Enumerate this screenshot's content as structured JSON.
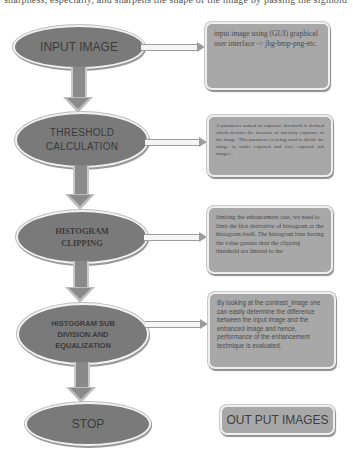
{
  "header": {
    "cut_text": "sharpness, especially, and sharpens the shape of the image by passing the sigmoid function"
  },
  "flowchart": {
    "steps": [
      {
        "id": "input-image",
        "label_lines": [
          "INPUT IMAGE"
        ]
      },
      {
        "id": "threshold-calculation",
        "label_lines": [
          "THRESHOLD",
          "CALCULATION"
        ]
      },
      {
        "id": "histogram-clipping",
        "label_lines": [
          "HISTOGRAM",
          "CLIPPING"
        ]
      },
      {
        "id": "histogram-sub-division",
        "label_lines": [
          "HISTOGRAM SUB",
          "DIVISION AND",
          "EQUALIZATION"
        ]
      },
      {
        "id": "stop",
        "label_lines": [
          "STOP"
        ]
      }
    ],
    "notes": [
      {
        "for": "input-image",
        "text": "input image using (GUI) graphical user interface -> jbg-bmp-png-etc."
      },
      {
        "for": "threshold-calculation",
        "text": "A parameter named as exposure threshold is defined which denotes the measure of intensity exposure of the image. This parameter is being used to divide the image in under exposed and over exposed sub images.."
      },
      {
        "for": "histogram-clipping",
        "text": "limiting the enhancement rate, we need to limit the first derivative of histogram or the histogram itself. The histogram bins having the value greater than the clipping threshold are limited to the"
      },
      {
        "for": "histogram-sub-division",
        "text": "By looking at the contrast_image one can easily determine the difference between the input image and the enhanced image and hence, performance of the enhancement technique is evaluated."
      },
      {
        "for": "stop",
        "text": "OUT PUT IMAGES"
      }
    ]
  },
  "colors": {
    "ellipse_fill": "#7a7a7a",
    "note_fill": "#a8a8a8",
    "arrow_fill": "#8a8a8a",
    "background": "#ffffff"
  }
}
